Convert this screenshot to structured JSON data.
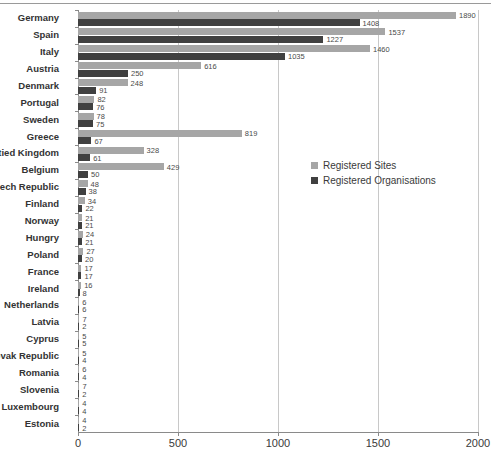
{
  "chart_data": {
    "type": "bar",
    "orientation": "horizontal",
    "title": "",
    "xlabel": "",
    "ylabel": "",
    "xlim": [
      0,
      2000
    ],
    "xticks": [
      0,
      500,
      1000,
      1500,
      2000
    ],
    "grid": true,
    "legend_position": "middle-right",
    "categories": [
      "Germany",
      "Spain",
      "Italy",
      "Austria",
      "Denmark",
      "Portugal",
      "Sweden",
      "Greece",
      "Untied Kingdom",
      "Belgium",
      "Czech Republic",
      "Finland",
      "Norway",
      "Hungry",
      "Poland",
      "France",
      "Ireland",
      "Netherlands",
      "Latvia",
      "Cyprus",
      "Slovak Republic",
      "Romania",
      "Slovenia",
      "Luxembourg",
      "Estonia"
    ],
    "series": [
      {
        "name": "Registered Sites",
        "color": "#a6a6a6",
        "values": [
          1890,
          1537,
          1460,
          616,
          248,
          82,
          78,
          819,
          328,
          429,
          48,
          34,
          21,
          24,
          27,
          17,
          16,
          6,
          7,
          5,
          5,
          6,
          7,
          4,
          4
        ]
      },
      {
        "name": "Registered Organisations",
        "color": "#404040",
        "values": [
          1408,
          1227,
          1035,
          250,
          91,
          76,
          75,
          67,
          61,
          50,
          38,
          22,
          21,
          21,
          20,
          17,
          8,
          6,
          2,
          5,
          4,
          4,
          2,
          4,
          2
        ]
      }
    ]
  },
  "legend": {
    "items": [
      {
        "label": "Registered Sites",
        "color": "#a6a6a6"
      },
      {
        "label": "Registered Organisations",
        "color": "#404040"
      }
    ]
  }
}
